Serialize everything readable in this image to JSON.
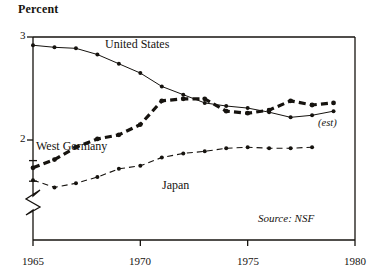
{
  "figure": {
    "y_axis_title": "Percent",
    "source_note": "Source: NSF",
    "est_note": "(est)"
  },
  "axis": {
    "y_ticks_major": [
      "3",
      "2"
    ],
    "x_ticks": [
      "1965",
      "1970",
      "1975",
      "1980"
    ]
  },
  "series_labels": {
    "us": "United States",
    "west_germany": "West Germany",
    "japan": "Japan"
  },
  "colors": {
    "ink": "#16130f",
    "background": "#ffffff"
  },
  "chart_data": {
    "type": "line",
    "title": "",
    "subtitle": "",
    "xlabel": "",
    "ylabel": "Percent",
    "xlim": [
      1965,
      1980
    ],
    "ylim": [
      1.48,
      3.0
    ],
    "y_axis_break": true,
    "y_axis_break_below": 1.6,
    "grid": false,
    "legend": "inline-annotations",
    "x_ticks": [
      1965,
      1970,
      1975,
      1980
    ],
    "y_ticks_major": [
      2,
      3
    ],
    "y_ticks_minor": [
      1.6,
      1.8
    ],
    "annotations": [
      {
        "text": "(est)",
        "x": 1979.2,
        "y": 2.23,
        "style": "italic"
      },
      {
        "text": "Source: NSF",
        "x": 1977.5,
        "y": 1.62,
        "style": "italic"
      }
    ],
    "x": [
      1965,
      1966,
      1967,
      1968,
      1969,
      1970,
      1971,
      1972,
      1973,
      1974,
      1975,
      1976,
      1977,
      1978,
      1979
    ],
    "series": [
      {
        "name": "United States",
        "style": "solid-thin-markers",
        "values": [
          2.92,
          2.9,
          2.89,
          2.83,
          2.74,
          2.65,
          2.52,
          2.44,
          2.36,
          2.33,
          2.31,
          2.27,
          2.22,
          2.24,
          2.28
        ]
      },
      {
        "name": "West Germany",
        "style": "thick-dashed-markers",
        "values": [
          1.73,
          1.81,
          1.93,
          2.01,
          2.05,
          2.15,
          2.38,
          2.4,
          2.4,
          2.28,
          2.26,
          2.29,
          2.38,
          2.34,
          2.36
        ]
      },
      {
        "name": "Japan",
        "style": "thin-dashed-markers",
        "values": [
          1.61,
          1.54,
          1.58,
          1.64,
          1.72,
          1.75,
          1.83,
          1.87,
          1.89,
          1.92,
          1.93,
          1.92,
          1.92,
          1.93,
          null
        ]
      }
    ]
  }
}
